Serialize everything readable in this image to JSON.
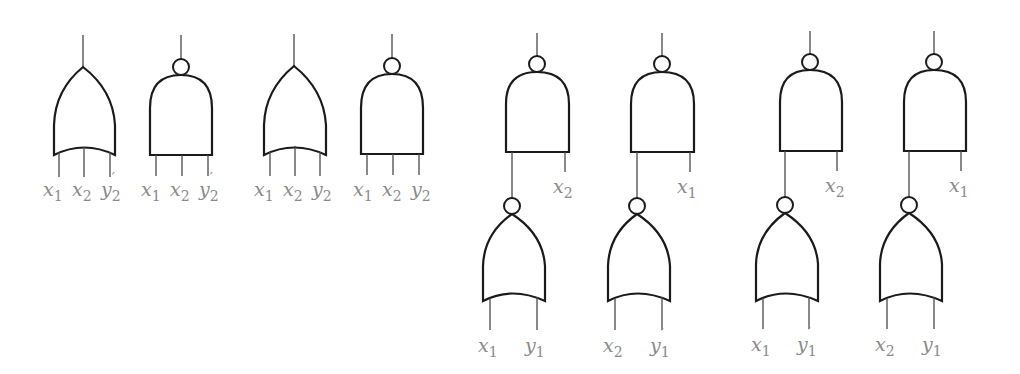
{
  "diagram": {
    "type": "logic-gate-circuits",
    "colors": {
      "gate_stroke": "#1a1a1a",
      "wire": "#4a4a4a",
      "label": "#8a8a8a",
      "background": "#ffffff"
    },
    "single_gates": [
      {
        "id": "g1",
        "kind": "OR",
        "inputs": [
          {
            "v": "x",
            "s": "1",
            "p": ""
          },
          {
            "v": "x",
            "s": "2",
            "p": ""
          },
          {
            "v": "y",
            "s": "2",
            "p": "′"
          }
        ]
      },
      {
        "id": "g2",
        "kind": "NAND",
        "inputs": [
          {
            "v": "x",
            "s": "1",
            "p": ""
          },
          {
            "v": "x",
            "s": "2",
            "p": ""
          },
          {
            "v": "y",
            "s": "2",
            "p": "′"
          }
        ]
      },
      {
        "id": "g3",
        "kind": "OR",
        "inputs": [
          {
            "v": "x",
            "s": "1",
            "p": ""
          },
          {
            "v": "x",
            "s": "2",
            "p": ""
          },
          {
            "v": "y",
            "s": "2",
            "p": ""
          }
        ]
      },
      {
        "id": "g4",
        "kind": "NAND",
        "inputs": [
          {
            "v": "x",
            "s": "1",
            "p": ""
          },
          {
            "v": "x",
            "s": "2",
            "p": ""
          },
          {
            "v": "y",
            "s": "2",
            "p": ""
          }
        ]
      }
    ],
    "two_level_circuits": [
      {
        "id": "c1",
        "top": "NAND",
        "top_extra_input": {
          "v": "x",
          "s": "2",
          "p": ""
        },
        "bottom": "NOR",
        "bottom_inputs": [
          {
            "v": "x",
            "s": "1",
            "p": ""
          },
          {
            "v": "y",
            "s": "1",
            "p": ""
          }
        ]
      },
      {
        "id": "c2",
        "top": "NAND",
        "top_extra_input": {
          "v": "x",
          "s": "1",
          "p": ""
        },
        "bottom": "NOR",
        "bottom_inputs": [
          {
            "v": "x",
            "s": "2",
            "p": ""
          },
          {
            "v": "y",
            "s": "1",
            "p": "′"
          }
        ]
      },
      {
        "id": "c3",
        "top": "NAND",
        "top_extra_input": {
          "v": "x",
          "s": "2",
          "p": ""
        },
        "bottom": "NOR",
        "bottom_inputs": [
          {
            "v": "x",
            "s": "1",
            "p": ""
          },
          {
            "v": "y",
            "s": "1",
            "p": "′"
          }
        ]
      },
      {
        "id": "c4",
        "top": "NAND",
        "top_extra_input": {
          "v": "x",
          "s": "1",
          "p": ""
        },
        "bottom": "NOR",
        "bottom_inputs": [
          {
            "v": "x",
            "s": "2",
            "p": ""
          },
          {
            "v": "y",
            "s": "1",
            "p": ""
          }
        ]
      }
    ]
  }
}
